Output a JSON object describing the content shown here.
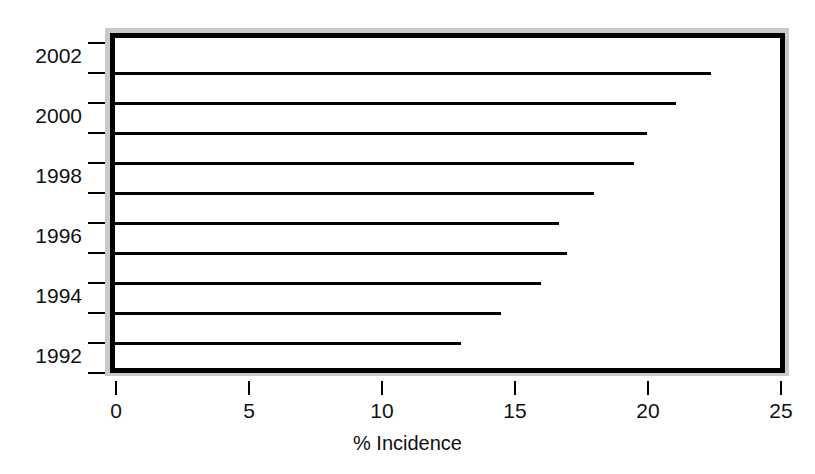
{
  "chart_data": {
    "type": "bar",
    "orientation": "horizontal",
    "title": "",
    "xlabel": "% Incidence",
    "ylabel": "",
    "xlim": [
      0,
      25
    ],
    "xticks": [
      0,
      5,
      10,
      15,
      20,
      25
    ],
    "xticklabels": [
      "0",
      "5",
      "10",
      "15",
      "20",
      "25"
    ],
    "yticklabels": [
      "1992",
      "1994",
      "1996",
      "1998",
      "2000",
      "2002"
    ],
    "grid": false,
    "legend": null,
    "bar_color": "#000000",
    "background_color": "#ffffff",
    "frame_color": "#000000",
    "frame_shadow_color": "#c9c9c9",
    "categories": [
      "1992",
      "1993",
      "1994",
      "1995",
      "1996",
      "1997",
      "1998",
      "1999",
      "2000",
      "2001",
      "2002"
    ],
    "values": [
      12.5,
      13.0,
      14.5,
      16.0,
      17.0,
      16.7,
      18.0,
      19.5,
      20.0,
      21.1,
      22.4
    ],
    "bars": [
      {
        "category": "2002",
        "value": 22.4
      },
      {
        "category": "2001",
        "value": 21.1
      },
      {
        "category": "2000",
        "value": 20.0
      },
      {
        "category": "1999",
        "value": 19.5
      },
      {
        "category": "1998",
        "value": 18.0
      },
      {
        "category": "1997",
        "value": 16.7
      },
      {
        "category": "1996",
        "value": 17.0
      },
      {
        "category": "1995",
        "value": 16.0
      },
      {
        "category": "1994",
        "value": 14.5
      },
      {
        "category": "1993",
        "value": 13.0
      },
      {
        "category": "1992",
        "value": 12.5
      }
    ]
  }
}
